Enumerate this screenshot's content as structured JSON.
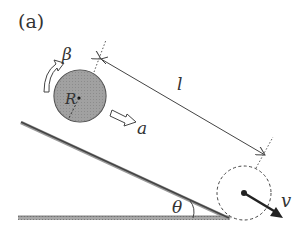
{
  "figure": {
    "panel_label": "(a)",
    "labels": {
      "angular_acceleration": "β",
      "radius": "R",
      "acceleration": "a",
      "length": "l",
      "angle": "θ",
      "velocity": "v"
    },
    "colors": {
      "ball_fill": "#9a9a9a",
      "line": "#444444",
      "background": "#ffffff"
    }
  }
}
